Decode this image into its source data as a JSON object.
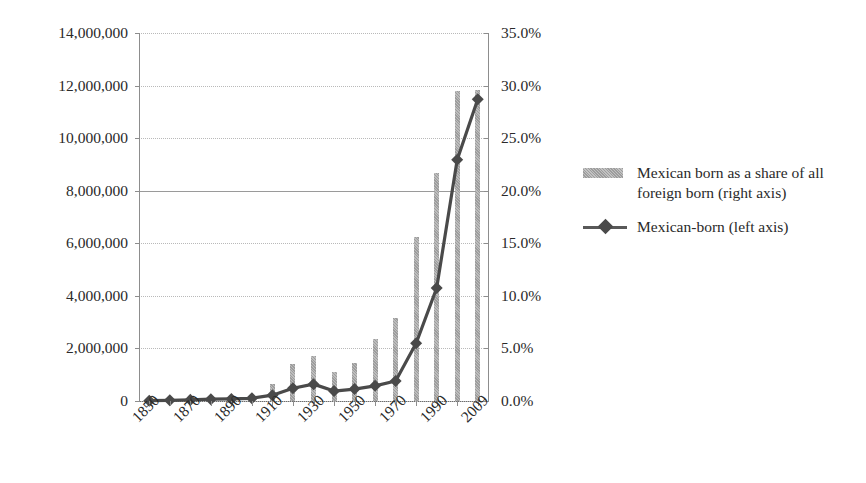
{
  "chart_data": {
    "type": "bar",
    "title": "",
    "subtitle": "",
    "xlabel": "",
    "ylabel": "",
    "y2label": "",
    "grid": true,
    "legend_position": "right",
    "x": [
      1850,
      1860,
      1870,
      1880,
      1890,
      1900,
      1910,
      1920,
      1930,
      1940,
      1950,
      1960,
      1970,
      1980,
      1990,
      2000,
      2009
    ],
    "x_tick_labels": [
      "1850",
      "1870",
      "1890",
      "1910",
      "1930",
      "1950",
      "1970",
      "1990",
      "2009"
    ],
    "x_tick_label_indices": [
      0,
      2,
      4,
      6,
      8,
      10,
      12,
      14,
      16
    ],
    "y_axis": {
      "min": 0,
      "max": 14000000,
      "step": 2000000,
      "tick_labels": [
        "0",
        "2,000,000",
        "4,000,000",
        "6,000,000",
        "8,000,000",
        "10,000,000",
        "12,000,000",
        "14,000,000"
      ]
    },
    "y2_axis": {
      "min": 0,
      "max": 0.35,
      "step": 0.05,
      "tick_labels": [
        "0.0%",
        "5.0%",
        "10.0%",
        "15.0%",
        "20.0%",
        "25.0%",
        "30.0%",
        "35.0%"
      ]
    },
    "series": [
      {
        "name": "Mexican born as a share of all foreign born (right axis)",
        "legend_label": "Mexican born as a share of all foreign born (right axis)",
        "type": "bar",
        "axis": "right",
        "color": "#a8a8a8",
        "unit": "percent",
        "values": [
          0.1,
          0.2,
          0.2,
          0.3,
          0.3,
          0.5,
          1.6,
          3.5,
          4.3,
          2.8,
          3.6,
          5.9,
          7.9,
          15.6,
          21.7,
          29.5,
          29.6
        ]
      },
      {
        "name": "Mexican-born (left axis)",
        "legend_label": "Mexican-born (left axis)",
        "type": "line",
        "axis": "left",
        "color": "#4a4a4a",
        "marker": "diamond",
        "unit": "persons",
        "values": [
          13317,
          27466,
          42435,
          68399,
          77853,
          103393,
          221915,
          486418,
          641462,
          377433,
          454000,
          575900,
          759700,
          2199200,
          4298000,
          9177000,
          11478000
        ]
      }
    ]
  },
  "legend": {
    "items": [
      {
        "key": "bar-swatch",
        "label": "Mexican born as a share of all foreign born (right axis)"
      },
      {
        "key": "line-marker",
        "label": "Mexican-born (left axis)"
      }
    ]
  },
  "colors": {
    "bar": "#a8a8a8",
    "line": "#4a4a4a",
    "grid": "#b9b9b9",
    "axis": "#8d8d8d",
    "text": "#2a2a2a",
    "background": "#ffffff"
  }
}
